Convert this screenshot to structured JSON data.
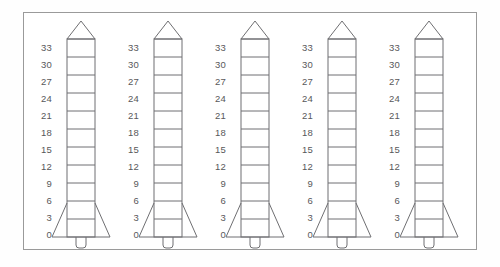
{
  "figure": {
    "title": "Five rocket diagrams with vertical measurement scales",
    "background_color": "#ffffff",
    "border_color": "#9a9a9a",
    "line_color": "#6f6f72",
    "label_color": "#58585a"
  },
  "scale": {
    "ticks": [
      "33",
      "30",
      "27",
      "24",
      "21",
      "18",
      "15",
      "12",
      "9",
      "6",
      "3",
      "0"
    ],
    "max": 33,
    "min": 0,
    "step": 3,
    "segment_count": 11
  },
  "rockets": [
    {
      "index": 1,
      "name": "rocket-1",
      "labels": [
        "33",
        "30",
        "27",
        "24",
        "21",
        "18",
        "15",
        "12",
        "9",
        "6",
        "3",
        "0"
      ]
    },
    {
      "index": 2,
      "name": "rocket-2",
      "labels": [
        "33",
        "30",
        "27",
        "24",
        "21",
        "18",
        "15",
        "12",
        "9",
        "6",
        "3",
        "0"
      ]
    },
    {
      "index": 3,
      "name": "rocket-3",
      "labels": [
        "33",
        "30",
        "27",
        "24",
        "21",
        "18",
        "15",
        "12",
        "9",
        "6",
        "3",
        "0"
      ]
    },
    {
      "index": 4,
      "name": "rocket-4",
      "labels": [
        "33",
        "30",
        "27",
        "24",
        "21",
        "18",
        "15",
        "12",
        "9",
        "6",
        "3",
        "0"
      ]
    },
    {
      "index": 5,
      "name": "rocket-5",
      "labels": [
        "33",
        "30",
        "27",
        "24",
        "21",
        "18",
        "15",
        "12",
        "9",
        "6",
        "3",
        "0"
      ]
    }
  ],
  "parts": {
    "nose_cone": "nose-cone",
    "body": "body-tube",
    "fins": "fin-triangle",
    "nozzle": "nozzle"
  }
}
